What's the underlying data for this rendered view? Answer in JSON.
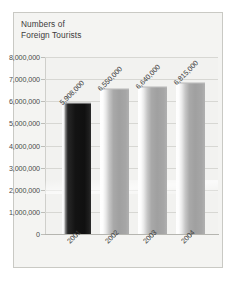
{
  "chart_data": {
    "type": "bar",
    "title": "Numbers of\nForeign Tourists",
    "xlabel": "",
    "ylabel": "",
    "categories": [
      "2001",
      "2002",
      "2003",
      "2004"
    ],
    "values": [
      5908000,
      6550000,
      6640000,
      6815000
    ],
    "data_labels": [
      "5,908,000",
      "6,550,000",
      "6,640,000",
      "6,815,000"
    ],
    "ylim": [
      0,
      8000000
    ],
    "ytick_labels": [
      "8,000,000",
      "7,000,000",
      "6,000,000",
      "5,000,000",
      "4,000,000",
      "3,000,000",
      "2,000,000",
      "1,000,000",
      "0"
    ],
    "ytick_values": [
      8000000,
      7000000,
      6000000,
      5000000,
      4000000,
      3000000,
      2000000,
      1000000,
      0
    ],
    "grid": true,
    "legend": false,
    "legend_position": "none",
    "series": [
      {
        "name": "Numbers of Foreign Tourists",
        "values": [
          5908000,
          6550000,
          6640000,
          6815000
        ]
      }
    ],
    "bar_colors": [
      "#141414",
      "#a6a6a6",
      "#a6a6a6",
      "#a6a6a6"
    ],
    "colors": {
      "background": "#f4f4f2",
      "plot_background": "#f2f2f0",
      "grid": "#d7d7d3",
      "axis": "#b5b5b0",
      "text": "#3d3d3d",
      "frame_border": "#c9c9c4",
      "bar_dark": "#141414",
      "bar_light": "#a6a6a6"
    }
  }
}
